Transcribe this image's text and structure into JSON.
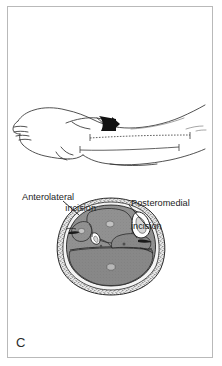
{
  "figure": {
    "panel_letter": "C"
  },
  "annotations": [
    {
      "id": "anterolateral",
      "line1": "Anterolateral",
      "line2": "incision",
      "full": "Anterolateral incision"
    },
    {
      "id": "posteromedial",
      "line1": "Posteromedial",
      "line2": "incision",
      "full": "Posteromedial incision"
    }
  ],
  "colors": {
    "ink": "#1d1d1d",
    "frame": "#b9b9b9",
    "muscle_fill": "#8e8e8e",
    "muscle_fill_dark": "#7a7a7a",
    "bone_fill": "#ffffff",
    "skin_line": "#3a3a3a",
    "subcutaneous": "#f2f2f2",
    "arrow_fill": "#111111",
    "background": "#ffffff"
  },
  "upper_illustration": {
    "name": "lateral view of lower leg and foot",
    "view": "lateral",
    "markers": [
      {
        "id": "anterolateral-incision-line",
        "style": "dashed",
        "description": "dashed incision line with end bars along anterolateral leg"
      },
      {
        "id": "posteromedial-incision-line",
        "style": "solid",
        "description": "solid incision line with end bars along posteromedial leg"
      },
      {
        "id": "arrow-marker",
        "style": "solid-black-wedge",
        "description": "solid black arrow indicating incision entry point"
      }
    ]
  },
  "cross_section": {
    "name": "axial cross-section of mid-leg",
    "compartments": [
      {
        "id": "anterior",
        "label": "",
        "fill": "#8e8e8e"
      },
      {
        "id": "lateral",
        "label": "",
        "fill": "#8e8e8e"
      },
      {
        "id": "deep-posterior",
        "label": "",
        "fill": "#8e8e8e"
      },
      {
        "id": "superficial-posterior",
        "label": "",
        "fill": "#8e8e8e"
      }
    ],
    "bones": [
      {
        "id": "tibia",
        "shape": "triangle",
        "fill": "#ffffff"
      },
      {
        "id": "fibula",
        "shape": "small-triangle",
        "fill": "#ffffff"
      }
    ],
    "incision_sites": [
      {
        "id": "anterolateral-site",
        "side": "left"
      },
      {
        "id": "posteromedial-site",
        "side": "right"
      }
    ]
  }
}
